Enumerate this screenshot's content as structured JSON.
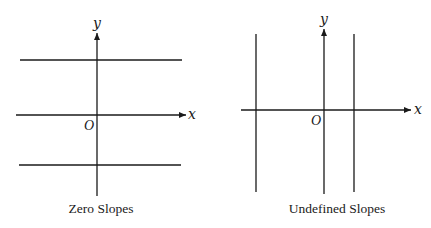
{
  "diagrams": [
    {
      "name": "zero-slopes",
      "caption": "Zero Slopes",
      "x_axis_label": "x",
      "y_axis_label": "y",
      "origin_label": "O",
      "lines": "horizontal"
    },
    {
      "name": "undefined-slopes",
      "caption": "Undefined Slopes",
      "x_axis_label": "x",
      "y_axis_label": "y",
      "origin_label": "O",
      "lines": "vertical"
    }
  ],
  "colors": {
    "line": "#1a1a1a",
    "background": "#ffffff"
  }
}
